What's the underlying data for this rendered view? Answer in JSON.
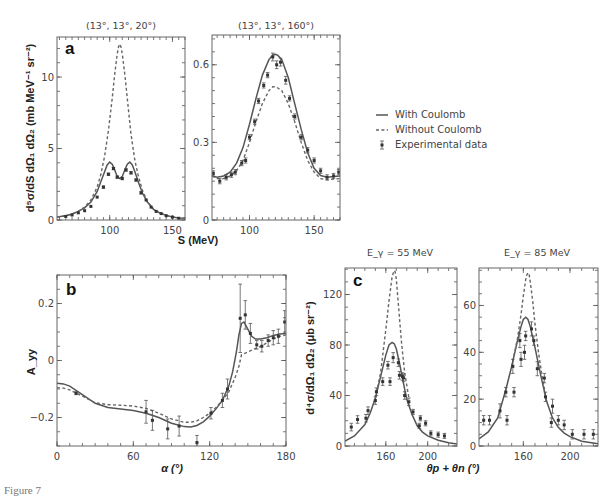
{
  "figure": {
    "caption": "Figure 7",
    "legend": {
      "items": [
        {
          "label": "With Coulomb",
          "style": "solid"
        },
        {
          "label": "Without Coulomb",
          "style": "dashed"
        },
        {
          "label": "Experimental data",
          "style": "marker-errorbar"
        }
      ]
    },
    "ylabel_a": "d⁵σ/dS dΩ₁ dΩ₂ (mb MeV⁻¹ sr⁻²)",
    "xlabel_a": "S (MeV)",
    "ylabel_b": "A_yy",
    "xlabel_b": "α (°)",
    "ylabel_c": "d⁴σ/dΩ₁ dΩ₂ (μb sr⁻²)",
    "xlabel_c": "θp + θn (°)"
  },
  "chart_data": [
    {
      "id": "a1",
      "panel_label": "a",
      "type": "line",
      "title": "(13°, 13°, 20°)",
      "xlabel": "S (MeV)",
      "ylabel": "d⁵σ/dS dΩ₁ dΩ₂ (mb MeV⁻¹ sr⁻²)",
      "xlim": [
        58,
        160
      ],
      "ylim": [
        0,
        12.8
      ],
      "xticks": [
        100,
        150
      ],
      "yticks": [
        0,
        5,
        10
      ],
      "series": [
        {
          "name": "With Coulomb",
          "style": "solid",
          "x": [
            58,
            65,
            70,
            75,
            80,
            85,
            90,
            93,
            96,
            98,
            100,
            102,
            104,
            106,
            108,
            110,
            112,
            114,
            116,
            118,
            120,
            123,
            126,
            130,
            135,
            140,
            145,
            150,
            155,
            160
          ],
          "y": [
            0.2,
            0.3,
            0.42,
            0.6,
            0.85,
            1.25,
            2.0,
            2.7,
            3.4,
            3.85,
            4.05,
            3.9,
            3.5,
            3.05,
            2.9,
            3.05,
            3.5,
            3.9,
            4.05,
            3.85,
            3.4,
            2.6,
            1.9,
            1.25,
            0.75,
            0.48,
            0.32,
            0.22,
            0.15,
            0.12
          ]
        },
        {
          "name": "Without Coulomb",
          "style": "dashed",
          "x": [
            58,
            65,
            70,
            75,
            80,
            85,
            90,
            93,
            96,
            99,
            102,
            104,
            106,
            107,
            108,
            109,
            110,
            112,
            114,
            117,
            120,
            123,
            126,
            130,
            135,
            140,
            145,
            150,
            155,
            160
          ],
          "y": [
            0.2,
            0.3,
            0.42,
            0.6,
            0.9,
            1.4,
            2.3,
            3.2,
            4.5,
            6.3,
            8.5,
            10.2,
            11.6,
            12.1,
            12.3,
            12.1,
            11.6,
            10.2,
            8.5,
            6.0,
            4.2,
            3.0,
            2.1,
            1.3,
            0.75,
            0.48,
            0.32,
            0.22,
            0.15,
            0.12
          ]
        },
        {
          "name": "Experimental data",
          "style": "points",
          "x": [
            65,
            70,
            75,
            80,
            85,
            90,
            95,
            99,
            103,
            106,
            110,
            113,
            117,
            121,
            125,
            129,
            133,
            137,
            141,
            145,
            150,
            155
          ],
          "y": [
            0.25,
            0.35,
            0.5,
            0.65,
            0.95,
            1.6,
            2.3,
            3.2,
            3.6,
            3.0,
            2.9,
            3.5,
            3.3,
            2.8,
            1.9,
            1.4,
            0.9,
            0.6,
            0.45,
            0.3,
            0.2,
            0.12
          ],
          "err": [
            0.05,
            0.05,
            0.05,
            0.05,
            0.05,
            0.05,
            0.08,
            0.08,
            0.08,
            0.08,
            0.08,
            0.08,
            0.08,
            0.08,
            0.08,
            0.05,
            0.05,
            0.05,
            0.05,
            0.05,
            0.05,
            0.05
          ]
        }
      ]
    },
    {
      "id": "a2",
      "panel_label": "",
      "type": "line",
      "title": "(13°, 13°, 160°)",
      "xlabel": "S (MeV)",
      "ylabel": "",
      "xlim": [
        71,
        170
      ],
      "ylim": [
        0,
        0.715
      ],
      "xticks": [
        100,
        150
      ],
      "yticks": [
        0,
        0.3,
        0.6
      ],
      "series": [
        {
          "name": "With Coulomb",
          "style": "solid",
          "x": [
            71,
            75,
            80,
            85,
            90,
            95,
            100,
            105,
            110,
            115,
            118,
            120,
            122,
            125,
            130,
            135,
            140,
            145,
            150,
            155,
            160,
            165,
            170
          ],
          "y": [
            0.17,
            0.165,
            0.17,
            0.185,
            0.22,
            0.28,
            0.37,
            0.47,
            0.56,
            0.62,
            0.638,
            0.64,
            0.636,
            0.62,
            0.55,
            0.45,
            0.35,
            0.26,
            0.2,
            0.172,
            0.165,
            0.168,
            0.17
          ]
        },
        {
          "name": "Without Coulomb",
          "style": "dashed",
          "x": [
            71,
            75,
            80,
            85,
            90,
            95,
            100,
            105,
            110,
            115,
            118,
            120,
            122,
            125,
            130,
            135,
            140,
            145,
            150,
            155,
            160,
            165,
            170
          ],
          "y": [
            0.17,
            0.16,
            0.16,
            0.17,
            0.19,
            0.23,
            0.3,
            0.38,
            0.45,
            0.5,
            0.515,
            0.515,
            0.51,
            0.5,
            0.45,
            0.38,
            0.3,
            0.23,
            0.185,
            0.16,
            0.155,
            0.158,
            0.16
          ]
        },
        {
          "name": "Experimental data",
          "style": "points",
          "x": [
            72,
            77,
            82,
            86,
            89,
            94,
            97,
            100,
            104,
            107,
            111,
            114,
            118,
            121,
            124,
            128,
            131,
            135,
            140,
            145,
            150,
            155,
            160,
            165,
            169
          ],
          "y": [
            0.18,
            0.15,
            0.165,
            0.175,
            0.185,
            0.22,
            0.23,
            0.32,
            0.38,
            0.46,
            0.52,
            0.56,
            0.63,
            0.6,
            0.61,
            0.54,
            0.47,
            0.4,
            0.32,
            0.27,
            0.23,
            0.19,
            0.165,
            0.17,
            0.185
          ],
          "err": [
            0.01,
            0.01,
            0.01,
            0.01,
            0.01,
            0.01,
            0.01,
            0.01,
            0.01,
            0.01,
            0.01,
            0.01,
            0.015,
            0.015,
            0.015,
            0.015,
            0.01,
            0.01,
            0.01,
            0.01,
            0.01,
            0.01,
            0.01,
            0.01,
            0.01
          ]
        }
      ]
    },
    {
      "id": "b",
      "panel_label": "b",
      "type": "line",
      "title": "",
      "xlabel": "α (°)",
      "ylabel": "A_yy",
      "xlim": [
        0,
        180
      ],
      "ylim": [
        -0.3,
        0.3
      ],
      "xticks": [
        0,
        60,
        120,
        180
      ],
      "yticks": [
        -0.2,
        0,
        0.2
      ],
      "series": [
        {
          "name": "With Coulomb",
          "style": "solid",
          "x": [
            0,
            5,
            10,
            20,
            30,
            40,
            50,
            60,
            70,
            80,
            90,
            100,
            105,
            110,
            115,
            120,
            125,
            130,
            135,
            138,
            141,
            143,
            145,
            147,
            150,
            153,
            156,
            160,
            165,
            170,
            175,
            180
          ],
          "y": [
            -0.08,
            -0.082,
            -0.09,
            -0.12,
            -0.15,
            -0.165,
            -0.17,
            -0.175,
            -0.185,
            -0.2,
            -0.22,
            -0.232,
            -0.233,
            -0.228,
            -0.215,
            -0.195,
            -0.17,
            -0.14,
            -0.09,
            -0.04,
            0.03,
            0.09,
            0.13,
            0.135,
            0.11,
            0.085,
            0.075,
            0.075,
            0.08,
            0.088,
            0.093,
            0.095
          ]
        },
        {
          "name": "Without Coulomb",
          "style": "dashed",
          "x": [
            0,
            5,
            10,
            20,
            30,
            40,
            50,
            60,
            70,
            80,
            90,
            100,
            105,
            110,
            115,
            120,
            125,
            130,
            135,
            140,
            143,
            145,
            150,
            155,
            160,
            165,
            170,
            175,
            180
          ],
          "y": [
            -0.095,
            -0.097,
            -0.103,
            -0.125,
            -0.148,
            -0.155,
            -0.157,
            -0.16,
            -0.168,
            -0.185,
            -0.205,
            -0.217,
            -0.217,
            -0.212,
            -0.2,
            -0.185,
            -0.165,
            -0.14,
            -0.11,
            -0.06,
            -0.02,
            0.02,
            0.03,
            0.04,
            0.05,
            0.062,
            0.075,
            0.085,
            0.09
          ]
        },
        {
          "name": "Experimental data",
          "style": "points",
          "x": [
            15,
            70,
            75,
            87,
            96,
            110,
            121,
            130,
            134,
            144,
            148,
            152,
            157,
            161,
            166,
            170,
            174,
            179
          ],
          "y": [
            -0.115,
            -0.18,
            -0.21,
            -0.24,
            -0.23,
            -0.288,
            -0.185,
            -0.14,
            -0.1,
            0.148,
            0.16,
            0.095,
            0.055,
            0.05,
            0.07,
            0.08,
            0.085,
            0.135
          ],
          "err": [
            0.005,
            0.04,
            0.035,
            0.035,
            0.035,
            0.025,
            0.02,
            0.025,
            0.035,
            0.12,
            0.05,
            0.035,
            0.015,
            0.02,
            0.02,
            0.025,
            0.025,
            0.04
          ]
        }
      ]
    },
    {
      "id": "c1",
      "panel_label": "c",
      "type": "line",
      "title": "E_γ = 55 MeV",
      "xlabel": "θp + θn (°)",
      "ylabel": "d⁴σ/dΩ₁ dΩ₂ (μb sr⁻²)",
      "xlim": [
        121,
        228
      ],
      "ylim": [
        0,
        141
      ],
      "xticks": [
        160,
        200
      ],
      "yticks": [
        0,
        40,
        80,
        120
      ],
      "series": [
        {
          "name": "With Coulomb",
          "style": "solid",
          "x": [
            121,
            130,
            140,
            145,
            150,
            155,
            160,
            163,
            166,
            168,
            170,
            173,
            176,
            180,
            185,
            190,
            195,
            200,
            210,
            220,
            228
          ],
          "y": [
            4,
            8,
            17,
            26,
            38,
            55,
            72,
            80,
            82,
            81,
            77,
            66,
            53,
            37,
            25,
            16,
            11,
            8,
            4.5,
            2.5,
            1.5
          ]
        },
        {
          "name": "Without Coulomb",
          "style": "dashed",
          "x": [
            150,
            155,
            160,
            163,
            166,
            168,
            169,
            170,
            172,
            175,
            178,
            182
          ],
          "y": [
            38,
            58,
            92,
            115,
            134,
            139,
            138,
            132,
            112,
            82,
            58,
            38
          ]
        },
        {
          "name": "Experimental data",
          "style": "points",
          "x": [
            127,
            133,
            141,
            143,
            150,
            151,
            157,
            162,
            164,
            167,
            172,
            173,
            176,
            177,
            178,
            182,
            186,
            192,
            193,
            198,
            203,
            210,
            216
          ],
          "y": [
            15,
            21,
            22,
            28,
            36,
            43,
            51,
            64,
            51,
            70,
            66,
            56,
            55,
            54,
            40,
            35,
            27,
            16,
            22,
            18,
            10,
            9,
            8
          ],
          "err": [
            3,
            3,
            3,
            3,
            3,
            3,
            3,
            3,
            3,
            4,
            3,
            3,
            3,
            3,
            3,
            3,
            2,
            2,
            2,
            2,
            2,
            2,
            2
          ]
        }
      ]
    },
    {
      "id": "c2",
      "panel_label": "",
      "type": "line",
      "title": "E_γ = 85 MeV",
      "xlabel": "θp + θn (°)",
      "ylabel": "",
      "xlim": [
        122,
        224
      ],
      "ylim": [
        0,
        76
      ],
      "xticks": [
        160,
        200
      ],
      "yticks": [
        0,
        20,
        40,
        60
      ],
      "series": [
        {
          "name": "With Coulomb",
          "style": "solid",
          "x": [
            122,
            130,
            138,
            145,
            150,
            155,
            158,
            160,
            162,
            164,
            166,
            170,
            175,
            180,
            185,
            190,
            195,
            200,
            210,
            224
          ],
          "y": [
            3,
            6,
            12,
            24,
            34,
            45,
            51,
            54,
            55,
            54,
            51,
            42,
            30,
            19,
            12,
            8,
            5.5,
            4,
            2,
            1
          ]
        },
        {
          "name": "Without Coulomb",
          "style": "dashed",
          "x": [
            150,
            155,
            158,
            160,
            162,
            163,
            164,
            165,
            166,
            168,
            170,
            173,
            176,
            180
          ],
          "y": [
            34,
            46,
            56,
            64,
            71,
            73,
            74,
            73,
            70,
            62,
            52,
            40,
            30,
            19
          ]
        },
        {
          "name": "Experimental data",
          "style": "points",
          "x": [
            126,
            131,
            140,
            145,
            146,
            151,
            152,
            157,
            158,
            161,
            162,
            167,
            169,
            172,
            178,
            179,
            184,
            185,
            190,
            195,
            202,
            212,
            220
          ],
          "y": [
            11,
            11,
            15,
            23,
            11,
            34,
            23,
            45,
            37,
            40,
            47,
            50,
            45,
            33,
            29,
            21,
            10,
            17,
            11,
            9,
            5,
            5,
            5
          ],
          "err": [
            2,
            2,
            3,
            2,
            2,
            3,
            2,
            3,
            3,
            3,
            2,
            3,
            2,
            3,
            2,
            2,
            2,
            3,
            2,
            2,
            2,
            2,
            2
          ]
        }
      ]
    }
  ]
}
